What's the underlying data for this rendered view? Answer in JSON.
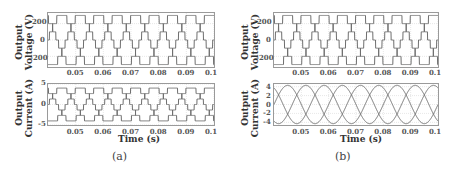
{
  "chart_data": [
    {
      "panel": "(a)",
      "type": "line",
      "title": "Output Voltage (V)",
      "ylabel": "Output Voltage (V)",
      "xlabel": "",
      "xlim": [
        0.04,
        0.1
      ],
      "ylim": [
        -330,
        330
      ],
      "xticks": [
        "0.05",
        "0.06",
        "0.07",
        "0.08",
        "0.09",
        "0.1"
      ],
      "yticks": [
        "200",
        "0",
        "-200"
      ],
      "grid": true,
      "waveform": "7-level stepped staircase, 3-phase, 50 Hz",
      "series": [
        {
          "name": "phase A",
          "amplitude": 300,
          "phase_deg": 0
        },
        {
          "name": "phase B",
          "amplitude": 300,
          "phase_deg": -120
        },
        {
          "name": "phase C",
          "amplitude": 300,
          "phase_deg": 120
        }
      ]
    },
    {
      "panel": "(a)",
      "type": "line",
      "ylabel": "Output Current (A)",
      "xlabel": "Time (s)",
      "xlim": [
        0.04,
        0.1
      ],
      "ylim": [
        -5,
        5
      ],
      "xticks": [
        "0.05",
        "0.06",
        "0.07",
        "0.08",
        "0.09",
        "0.1"
      ],
      "yticks": [
        "5",
        "0",
        "-5"
      ],
      "grid": true,
      "waveform": "stepped staircase current, 3-phase, 50 Hz",
      "series": [
        {
          "name": "phase A",
          "amplitude": 4,
          "phase_deg": 0
        },
        {
          "name": "phase B",
          "amplitude": 4,
          "phase_deg": -120
        },
        {
          "name": "phase C",
          "amplitude": 4,
          "phase_deg": 120
        }
      ]
    },
    {
      "panel": "(b)",
      "type": "line",
      "ylabel": "Output Voltage (V)",
      "xlabel": "",
      "xlim": [
        0.04,
        0.1
      ],
      "ylim": [
        -330,
        330
      ],
      "xticks": [
        "0.05",
        "0.06",
        "0.07",
        "0.08",
        "0.09",
        "0.1"
      ],
      "yticks": [
        "200",
        "0",
        "-200"
      ],
      "grid": true,
      "waveform": "7-level stepped staircase, 3-phase, 50 Hz",
      "series": [
        {
          "name": "phase A",
          "amplitude": 300,
          "phase_deg": 0
        },
        {
          "name": "phase B",
          "amplitude": 300,
          "phase_deg": -120
        },
        {
          "name": "phase C",
          "amplitude": 300,
          "phase_deg": 120
        }
      ]
    },
    {
      "panel": "(b)",
      "type": "line",
      "ylabel": "Output Current (A)",
      "xlabel": "Time (s)",
      "xlim": [
        0.04,
        0.1
      ],
      "ylim": [
        -4.6,
        4.6
      ],
      "xticks": [
        "0.05",
        "0.06",
        "0.07",
        "0.08",
        "0.09",
        "0.1"
      ],
      "yticks": [
        "4",
        "2",
        "0",
        "-2",
        "-4"
      ],
      "grid": true,
      "waveform": "sinusoidal current, 3-phase, 50 Hz",
      "series": [
        {
          "name": "phase A",
          "amplitude": 4.3,
          "phase_deg": 0
        },
        {
          "name": "phase B",
          "amplitude": 4.3,
          "phase_deg": -120
        },
        {
          "name": "phase C",
          "amplitude": 4.3,
          "phase_deg": 120
        }
      ]
    }
  ],
  "labels": {
    "voltage_l1": "Output",
    "voltage_l2": "Voltage (V)",
    "current_l1": "Output",
    "current_l2": "Current (A)",
    "time": "Time (s)",
    "cap_a": "(a)",
    "cap_b": "(b)"
  },
  "colors": {
    "line": "#6e6e6e",
    "grid": "#d8d8d8",
    "axis": "#9a9a9a"
  }
}
